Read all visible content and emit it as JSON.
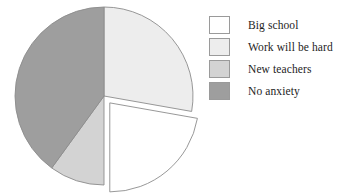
{
  "chart_data": {
    "type": "pie",
    "title": "",
    "subtitle": "",
    "xlabel": "",
    "ylabel": "",
    "grid": false,
    "legend_position": "right",
    "start_angle_deg": 0,
    "direction": "clockwise",
    "center": {
      "x": 104,
      "y": 96
    },
    "radius": 89,
    "categories": [
      "Big school",
      "Work will be hard",
      "New teachers",
      "No anxiety"
    ],
    "values": [
      22,
      28,
      10,
      40
    ],
    "units": "percent",
    "slices": [
      {
        "label": "Big school",
        "value": 22,
        "color": "#ffffff",
        "edge_color": "#8c8c8c",
        "start_deg": 100,
        "end_deg": 180,
        "exploded": true,
        "explode_offset_px": 9
      },
      {
        "label": "Work will be hard",
        "value": 28,
        "color": "#ededed",
        "edge_color": "#8c8c8c",
        "start_deg": 0,
        "end_deg": 100,
        "exploded": false,
        "explode_offset_px": 0
      },
      {
        "label": "New teachers",
        "value": 10,
        "color": "#d3d3d3",
        "edge_color": "#8c8c8c",
        "start_deg": 180,
        "end_deg": 216,
        "exploded": false,
        "explode_offset_px": 0
      },
      {
        "label": "No anxiety",
        "value": 40,
        "color": "#9e9e9e",
        "edge_color": "#8c8c8c",
        "start_deg": 216,
        "end_deg": 360,
        "exploded": false,
        "explode_offset_px": 0
      }
    ]
  },
  "legend": {
    "items": [
      {
        "label": "Big school",
        "color": "#ffffff"
      },
      {
        "label": "Work will be hard",
        "color": "#ededed"
      },
      {
        "label": "New teachers",
        "color": "#d3d3d3"
      },
      {
        "label": "No anxiety",
        "color": "#9e9e9e"
      }
    ]
  }
}
